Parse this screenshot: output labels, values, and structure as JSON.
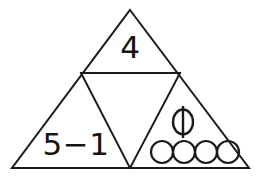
{
  "figure": {
    "background_color": "#ffffff",
    "line_color": "#1a1a1a",
    "text_color": "#141414"
  },
  "geometry": {
    "outer_triangle": {
      "apex": [
        130,
        10
      ],
      "bottom_left": [
        12,
        168
      ],
      "bottom_right": [
        249,
        168
      ]
    },
    "midpoints": {
      "left": [
        81,
        73
      ],
      "right": [
        180,
        73
      ],
      "bottom": [
        130,
        168
      ]
    }
  },
  "cells": {
    "top": {
      "label": "4",
      "position": [
        130,
        58
      ]
    },
    "middle_inverted": {
      "label": "",
      "position": [
        130,
        120
      ]
    },
    "bottom_left": {
      "label": "5−1",
      "position": [
        76,
        155
      ]
    },
    "bottom_right": {
      "phi_symbol": "ϕ",
      "phi_position": [
        183,
        122
      ],
      "circle_count": 4,
      "circle_radius": 11,
      "circle_centers": [
        [
          162,
          152
        ],
        [
          184,
          152
        ],
        [
          206,
          152
        ],
        [
          228,
          152
        ]
      ]
    }
  }
}
